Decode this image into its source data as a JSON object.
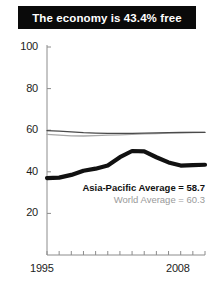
{
  "title": {
    "text": "The economy is 43.4% free"
  },
  "legend": {
    "asia_pacific": "Asia-Pacific Average = 58.7",
    "world": "World Average = 60.3"
  },
  "colors": {
    "banner_bg": "#0a0a0a",
    "banner_text": "#ffffff",
    "asia_line": "#111111",
    "world_line": "#a8a8a8",
    "secondary_line": "#4a4a4a",
    "axis": "#8c8c8c",
    "tick_text": "#1c1c1c",
    "world_text": "#9a9a9a"
  },
  "chart_data": {
    "type": "line",
    "title": "The economy is 43.4% free",
    "xlabel": "",
    "ylabel": "",
    "xlim": [
      1995,
      2008
    ],
    "ylim": [
      0,
      100
    ],
    "yticks": [
      20,
      40,
      60,
      80,
      100
    ],
    "xticks": [
      1995,
      1996,
      1997,
      1998,
      1999,
      2000,
      2001,
      2002,
      2003,
      2004,
      2005,
      2006,
      2007,
      2008
    ],
    "xtick_labels_shown": [
      "1995",
      "2008"
    ],
    "grid": false,
    "legend_position": "inside-center-right",
    "x": [
      1995,
      1996,
      1997,
      1998,
      1999,
      2000,
      2001,
      2002,
      2003,
      2004,
      2005,
      2006,
      2007,
      2008
    ],
    "series": [
      {
        "name": "Asia-Pacific Average",
        "label": "Asia-Pacific Average = 58.7",
        "color": "#111111",
        "width": "thick",
        "values": [
          37.0,
          37.2,
          38.5,
          40.5,
          41.5,
          43.0,
          47.0,
          50.0,
          49.8,
          47.0,
          44.5,
          43.0,
          43.2,
          43.4
        ]
      },
      {
        "name": "World Average",
        "label": "World Average = 60.3",
        "color": "#a8a8a8",
        "width": "thin",
        "values": [
          58.0,
          57.6,
          57.3,
          57.2,
          57.4,
          57.6,
          57.8,
          58.0,
          58.2,
          58.4,
          58.6,
          58.8,
          58.9,
          59.0
        ]
      },
      {
        "name": "Secondary Average",
        "label": "",
        "color": "#4a4a4a",
        "width": "thin",
        "values": [
          59.8,
          59.6,
          59.2,
          58.8,
          58.6,
          58.5,
          58.5,
          58.5,
          58.6,
          58.7,
          58.8,
          58.9,
          59.0,
          59.0
        ]
      }
    ]
  }
}
